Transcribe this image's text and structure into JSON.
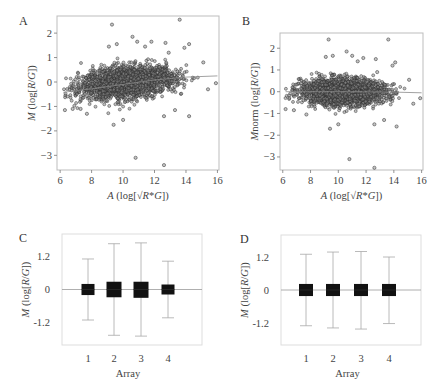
{
  "chart_data": [
    {
      "panel": "A",
      "type": "scatter",
      "title": "",
      "xlabel": "A (log[√R*G])",
      "ylabel": "M (log[R/G])",
      "xlim": [
        5.8,
        16.1
      ],
      "ylim": [
        -3.6,
        2.7
      ],
      "xticks": [
        6,
        8,
        10,
        12,
        14,
        16
      ],
      "yticks": [
        2,
        1,
        0,
        -1,
        -2,
        -3
      ],
      "frame": {
        "x0": 57,
        "y0": 16,
        "x1": 219,
        "y1": 170
      },
      "cloud": {
        "n": 2200,
        "x_center": 10.3,
        "x_sd": 1.5,
        "y_slope": 0.07,
        "y_intercept_at_10": -0.05,
        "y_sd": 0.28,
        "x_min": 6.1,
        "x_max": 14.8
      },
      "trend_line": [
        [
          6.2,
          -0.42
        ],
        [
          8,
          -0.28
        ],
        [
          10,
          -0.1
        ],
        [
          12,
          0.08
        ],
        [
          14,
          0.2
        ],
        [
          16,
          0.25
        ]
      ],
      "outliers": [
        [
          9.3,
          2.35
        ],
        [
          13.6,
          2.55
        ],
        [
          10.6,
          1.85
        ],
        [
          10.9,
          1.65
        ],
        [
          11.8,
          1.65
        ],
        [
          12.7,
          1.6
        ],
        [
          9.6,
          1.55
        ],
        [
          9.1,
          1.45
        ],
        [
          11.4,
          1.45
        ],
        [
          14.2,
          1.55
        ],
        [
          13.9,
          1.4
        ],
        [
          12.9,
          1.2
        ],
        [
          15.1,
          0.8
        ],
        [
          15.9,
          -0.05
        ],
        [
          15.4,
          -0.3
        ],
        [
          9.4,
          -1.75
        ],
        [
          10.0,
          -1.55
        ],
        [
          12.6,
          -1.4
        ],
        [
          13.3,
          -1.15
        ],
        [
          14.2,
          -1.4
        ],
        [
          10.8,
          -3.1
        ],
        [
          12.6,
          -3.4
        ],
        [
          7.7,
          -1.3
        ],
        [
          6.3,
          -1.15
        ],
        [
          6.8,
          -1.1
        ],
        [
          7.3,
          -1.1
        ]
      ]
    },
    {
      "panel": "B",
      "type": "scatter",
      "title": "",
      "xlabel": "A (log[√R*G])",
      "ylabel": "Mnorm (log[R/G])",
      "xlim": [
        5.8,
        16.1
      ],
      "ylim": [
        -3.6,
        2.7
      ],
      "xticks": [
        6,
        8,
        10,
        12,
        14,
        16
      ],
      "yticks": [
        2,
        1,
        0,
        -1,
        -2,
        -3
      ],
      "frame": {
        "x0": 280,
        "y0": 33,
        "x1": 423,
        "y1": 170
      },
      "cloud": {
        "n": 2200,
        "x_center": 10.3,
        "x_sd": 1.5,
        "y_slope": 0.0,
        "y_intercept_at_10": 0.0,
        "y_sd": 0.27,
        "x_min": 6.1,
        "x_max": 14.8
      },
      "trend_line": [
        [
          6.2,
          0.0
        ],
        [
          10,
          0.0
        ],
        [
          14,
          -0.02
        ],
        [
          16,
          -0.05
        ]
      ],
      "outliers": [
        [
          9.3,
          2.4
        ],
        [
          13.6,
          2.4
        ],
        [
          10.6,
          1.85
        ],
        [
          11.0,
          1.65
        ],
        [
          11.8,
          1.55
        ],
        [
          12.7,
          1.5
        ],
        [
          9.6,
          1.65
        ],
        [
          9.1,
          1.6
        ],
        [
          11.4,
          1.4
        ],
        [
          14.1,
          1.35
        ],
        [
          13.9,
          1.2
        ],
        [
          12.8,
          0.9
        ],
        [
          15.1,
          0.55
        ],
        [
          15.9,
          -0.3
        ],
        [
          15.4,
          -0.55
        ],
        [
          9.4,
          -1.7
        ],
        [
          10.0,
          -1.5
        ],
        [
          12.6,
          -1.5
        ],
        [
          13.3,
          -1.3
        ],
        [
          14.2,
          -1.6
        ],
        [
          10.8,
          -3.1
        ],
        [
          12.6,
          -3.5
        ],
        [
          7.7,
          -1.05
        ],
        [
          6.2,
          -0.8
        ],
        [
          6.8,
          -0.85
        ]
      ]
    },
    {
      "panel": "C",
      "type": "box",
      "title": "",
      "xlabel": "Array",
      "ylabel": "M (log[R/G])",
      "ylim": [
        -2.0,
        2.0
      ],
      "yticks": [
        1.2,
        0,
        -1.2
      ],
      "ytick_labels": [
        "1.2",
        "0",
        "-1.2"
      ],
      "categories": [
        "1",
        "2",
        "3",
        "4"
      ],
      "frame": {
        "x0": 62,
        "y0": 234,
        "x1": 202,
        "y1": 345
      },
      "boxes": [
        {
          "array": "1",
          "whisker_high": 1.1,
          "q3": 0.2,
          "median": 0.0,
          "q1": -0.2,
          "whisker_low": -1.1
        },
        {
          "array": "2",
          "whisker_high": 1.65,
          "q3": 0.28,
          "median": 0.0,
          "q1": -0.28,
          "whisker_low": -1.65
        },
        {
          "array": "3",
          "whisker_high": 1.68,
          "q3": 0.28,
          "median": 0.0,
          "q1": -0.3,
          "whisker_low": -1.68
        },
        {
          "array": "4",
          "whisker_high": 1.02,
          "q3": 0.18,
          "median": 0.0,
          "q1": -0.18,
          "whisker_low": -1.02
        }
      ]
    },
    {
      "panel": "D",
      "type": "box",
      "title": "",
      "xlabel": "Array",
      "ylabel": "M (log[R/G])",
      "ylim": [
        -2.0,
        2.0
      ],
      "yticks": [
        1.2,
        0,
        -1.2
      ],
      "ytick_labels": [
        "1.2",
        "0",
        "-1.2"
      ],
      "categories": [
        "1",
        "2",
        "3",
        "4"
      ],
      "frame": {
        "x0": 281,
        "y0": 235,
        "x1": 421,
        "y1": 345
      },
      "boxes": [
        {
          "array": "1",
          "whisker_high": 1.3,
          "q3": 0.22,
          "median": 0.0,
          "q1": -0.22,
          "whisker_low": -1.3
        },
        {
          "array": "2",
          "whisker_high": 1.38,
          "q3": 0.22,
          "median": 0.0,
          "q1": -0.22,
          "whisker_low": -1.38
        },
        {
          "array": "3",
          "whisker_high": 1.4,
          "q3": 0.22,
          "median": 0.0,
          "q1": -0.22,
          "whisker_low": -1.42
        },
        {
          "array": "4",
          "whisker_high": 1.2,
          "q3": 0.22,
          "median": 0.0,
          "q1": -0.22,
          "whisker_low": -1.22
        }
      ]
    }
  ],
  "labels": {
    "panel_a": "A",
    "panel_b": "B",
    "panel_c": "C",
    "panel_d": "D"
  },
  "colors": {
    "frame": "#bdbdbd",
    "point_fill": "#8a8a8a",
    "point_stroke": "#2a2a2a",
    "box_fill": "#111111",
    "whisker": "#a8a8a8",
    "zero_line": "#9a9a9a",
    "text": "#444444"
  }
}
